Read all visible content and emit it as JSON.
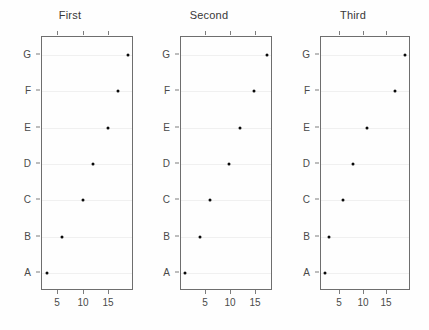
{
  "chart_data": [
    {
      "type": "scatter",
      "title": "First",
      "xlabel": "",
      "ylabel": "",
      "categories": [
        "A",
        "B",
        "C",
        "D",
        "E",
        "F",
        "G"
      ],
      "values": [
        3.0,
        6.0,
        10.0,
        11.9,
        15.0,
        16.9,
        18.8
      ],
      "xticks": [
        5,
        10,
        15
      ],
      "xtick_labels": [
        "5",
        "10",
        "15"
      ],
      "xlim": [
        2.0,
        19.6
      ],
      "grid": true,
      "legend": "none",
      "point_color": "#0a0a0a",
      "grid_color": "#f0f0f0",
      "axis_color": "#6e6e6e"
    },
    {
      "type": "scatter",
      "title": "Second",
      "xlabel": "",
      "ylabel": "",
      "categories": [
        "A",
        "B",
        "C",
        "D",
        "E",
        "F",
        "G"
      ],
      "values": [
        1.0,
        4.0,
        6.0,
        9.9,
        12.1,
        14.8,
        17.5
      ],
      "xticks": [
        5,
        10,
        15
      ],
      "xtick_labels": [
        "5",
        "10",
        "15"
      ],
      "xlim": [
        0.3,
        18.3
      ],
      "grid": true,
      "legend": "none",
      "point_color": "#0a0a0a",
      "grid_color": "#f0f0f0",
      "axis_color": "#6e6e6e"
    },
    {
      "type": "scatter",
      "title": "Third",
      "xlabel": "",
      "ylabel": "",
      "categories": [
        "A",
        "B",
        "C",
        "D",
        "E",
        "F",
        "G"
      ],
      "values": [
        2.0,
        2.8,
        5.8,
        8.0,
        10.9,
        16.8,
        18.9
      ],
      "xticks": [
        5,
        10,
        15
      ],
      "xtick_labels": [
        "5",
        "10",
        "15"
      ],
      "xlim": [
        1.2,
        19.8
      ],
      "grid": true,
      "legend": "none",
      "point_color": "#0a0a0a",
      "grid_color": "#f0f0f0",
      "axis_color": "#6e6e6e"
    }
  ],
  "figure": {
    "background": "#fefefe",
    "panel_count": 3,
    "shared_y_categories": [
      "A",
      "B",
      "C",
      "D",
      "E",
      "F",
      "G"
    ]
  }
}
